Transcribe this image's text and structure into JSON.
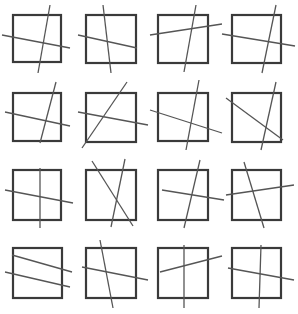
{
  "figure": {
    "width": 298,
    "height": 314,
    "background_color": "#ffffff",
    "square_stroke_color": "#3a3a3a",
    "square_stroke_width": 2.2,
    "line_stroke_color": "#555555",
    "line_stroke_width": 1.3,
    "grid_rows": 4,
    "grid_cols": 4,
    "panel_count": 16
  },
  "panels": [
    {
      "id": "panel-r1c1",
      "row": 1,
      "col": 1,
      "square": {
        "x": 13,
        "y": 15,
        "w": 48,
        "h": 47
      },
      "lines": [
        {
          "name": "steep-line",
          "x1": 50,
          "y1": 5,
          "x2": 38,
          "y2": 73
        },
        {
          "name": "shallow-line",
          "x1": 2,
          "y1": 35,
          "x2": 70,
          "y2": 48
        }
      ]
    },
    {
      "id": "panel-r1c2",
      "row": 1,
      "col": 2,
      "square": {
        "x": 86,
        "y": 15,
        "w": 50,
        "h": 48
      },
      "lines": [
        {
          "name": "steep-line",
          "x1": 103,
          "y1": 5,
          "x2": 111,
          "y2": 73
        },
        {
          "name": "shallow-line",
          "x1": 78,
          "y1": 35,
          "x2": 137,
          "y2": 48
        }
      ]
    },
    {
      "id": "panel-r1c3",
      "row": 1,
      "col": 3,
      "square": {
        "x": 158,
        "y": 15,
        "w": 50,
        "h": 48
      },
      "lines": [
        {
          "name": "steep-line",
          "x1": 196,
          "y1": 5,
          "x2": 184,
          "y2": 72
        },
        {
          "name": "shallow-line",
          "x1": 150,
          "y1": 35,
          "x2": 222,
          "y2": 24
        }
      ]
    },
    {
      "id": "panel-r1c4",
      "row": 1,
      "col": 4,
      "square": {
        "x": 232,
        "y": 15,
        "w": 49,
        "h": 48
      },
      "lines": [
        {
          "name": "steep-line",
          "x1": 276,
          "y1": 5,
          "x2": 262,
          "y2": 73
        },
        {
          "name": "shallow-line",
          "x1": 222,
          "y1": 34,
          "x2": 295,
          "y2": 46
        }
      ]
    },
    {
      "id": "panel-r2c1",
      "row": 2,
      "col": 1,
      "square": {
        "x": 13,
        "y": 93,
        "w": 48,
        "h": 48
      },
      "lines": [
        {
          "name": "steep-line",
          "x1": 56,
          "y1": 82,
          "x2": 40,
          "y2": 143
        },
        {
          "name": "shallow-line",
          "x1": 5,
          "y1": 112,
          "x2": 70,
          "y2": 126
        }
      ]
    },
    {
      "id": "panel-r2c2",
      "row": 2,
      "col": 2,
      "square": {
        "x": 86,
        "y": 93,
        "w": 50,
        "h": 49
      },
      "lines": [
        {
          "name": "rising-diagonal-line",
          "x1": 82,
          "y1": 148,
          "x2": 127,
          "y2": 82
        },
        {
          "name": "shallow-line",
          "x1": 78,
          "y1": 112,
          "x2": 148,
          "y2": 125
        }
      ]
    },
    {
      "id": "panel-r2c3",
      "row": 2,
      "col": 3,
      "square": {
        "x": 158,
        "y": 93,
        "w": 50,
        "h": 48
      },
      "lines": [
        {
          "name": "steep-line",
          "x1": 199,
          "y1": 80,
          "x2": 186,
          "y2": 150
        },
        {
          "name": "shallow-line",
          "x1": 150,
          "y1": 110,
          "x2": 222,
          "y2": 133
        }
      ]
    },
    {
      "id": "panel-r2c4",
      "row": 2,
      "col": 4,
      "square": {
        "x": 232,
        "y": 93,
        "w": 49,
        "h": 49
      },
      "lines": [
        {
          "name": "steep-line",
          "x1": 276,
          "y1": 82,
          "x2": 261,
          "y2": 150
        },
        {
          "name": "falling-diagonal-line",
          "x1": 226,
          "y1": 98,
          "x2": 283,
          "y2": 140
        }
      ]
    },
    {
      "id": "panel-r3c1",
      "row": 3,
      "col": 1,
      "square": {
        "x": 13,
        "y": 170,
        "w": 48,
        "h": 50
      },
      "lines": [
        {
          "name": "vertical-line",
          "x1": 40,
          "y1": 168,
          "x2": 40,
          "y2": 228
        },
        {
          "name": "shallow-line",
          "x1": 5,
          "y1": 190,
          "x2": 73,
          "y2": 203
        }
      ]
    },
    {
      "id": "panel-r3c2",
      "row": 3,
      "col": 2,
      "square": {
        "x": 86,
        "y": 170,
        "w": 50,
        "h": 50
      },
      "lines": [
        {
          "name": "falling-diagonal-line",
          "x1": 92,
          "y1": 161,
          "x2": 133,
          "y2": 226
        },
        {
          "name": "steep-line",
          "x1": 125,
          "y1": 159,
          "x2": 111,
          "y2": 227
        }
      ]
    },
    {
      "id": "panel-r3c3",
      "row": 3,
      "col": 3,
      "square": {
        "x": 158,
        "y": 170,
        "w": 50,
        "h": 50
      },
      "lines": [
        {
          "name": "steep-line",
          "x1": 200,
          "y1": 160,
          "x2": 184,
          "y2": 228
        },
        {
          "name": "shallow-line",
          "x1": 162,
          "y1": 190,
          "x2": 224,
          "y2": 200
        }
      ]
    },
    {
      "id": "panel-r3c4",
      "row": 3,
      "col": 4,
      "square": {
        "x": 232,
        "y": 170,
        "w": 49,
        "h": 50
      },
      "lines": [
        {
          "name": "steep-line",
          "x1": 244,
          "y1": 162,
          "x2": 264,
          "y2": 228
        },
        {
          "name": "shallow-line",
          "x1": 226,
          "y1": 195,
          "x2": 294,
          "y2": 185
        }
      ]
    },
    {
      "id": "panel-r4c1",
      "row": 4,
      "col": 1,
      "square": {
        "x": 13,
        "y": 248,
        "w": 49,
        "h": 50
      },
      "lines": [
        {
          "name": "upper-shallow-line",
          "x1": 12,
          "y1": 255,
          "x2": 72,
          "y2": 272
        },
        {
          "name": "lower-shallow-line",
          "x1": 5,
          "y1": 272,
          "x2": 70,
          "y2": 287
        }
      ]
    },
    {
      "id": "panel-r4c2",
      "row": 4,
      "col": 2,
      "square": {
        "x": 86,
        "y": 248,
        "w": 50,
        "h": 50
      },
      "lines": [
        {
          "name": "steep-line",
          "x1": 100,
          "y1": 240,
          "x2": 113,
          "y2": 308
        },
        {
          "name": "shallow-line",
          "x1": 82,
          "y1": 267,
          "x2": 148,
          "y2": 280
        }
      ]
    },
    {
      "id": "panel-r4c3",
      "row": 4,
      "col": 3,
      "square": {
        "x": 158,
        "y": 248,
        "w": 50,
        "h": 50
      },
      "lines": [
        {
          "name": "vertical-line",
          "x1": 184,
          "y1": 245,
          "x2": 184,
          "y2": 308
        },
        {
          "name": "shallow-line",
          "x1": 160,
          "y1": 272,
          "x2": 222,
          "y2": 256
        }
      ]
    },
    {
      "id": "panel-r4c4",
      "row": 4,
      "col": 4,
      "square": {
        "x": 232,
        "y": 248,
        "w": 49,
        "h": 50
      },
      "lines": [
        {
          "name": "vertical-line",
          "x1": 261,
          "y1": 245,
          "x2": 259,
          "y2": 308
        },
        {
          "name": "shallow-line",
          "x1": 228,
          "y1": 268,
          "x2": 294,
          "y2": 280
        }
      ]
    }
  ]
}
